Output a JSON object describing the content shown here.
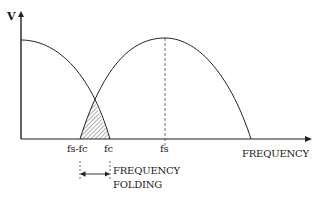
{
  "diagram": {
    "type": "frequency-folding-spectrum",
    "y_axis_label": "V",
    "x_axis_label": "FREQUENCY",
    "tick_labels": {
      "fs_minus_fc": "fs-fc",
      "fc": "fc",
      "fs": "fs"
    },
    "annotation": {
      "line1": "FREQUENCY",
      "line2": "FOLDING"
    },
    "colors": {
      "stroke": "#222222",
      "hatch": "#333333",
      "background": "#ffffff"
    }
  }
}
